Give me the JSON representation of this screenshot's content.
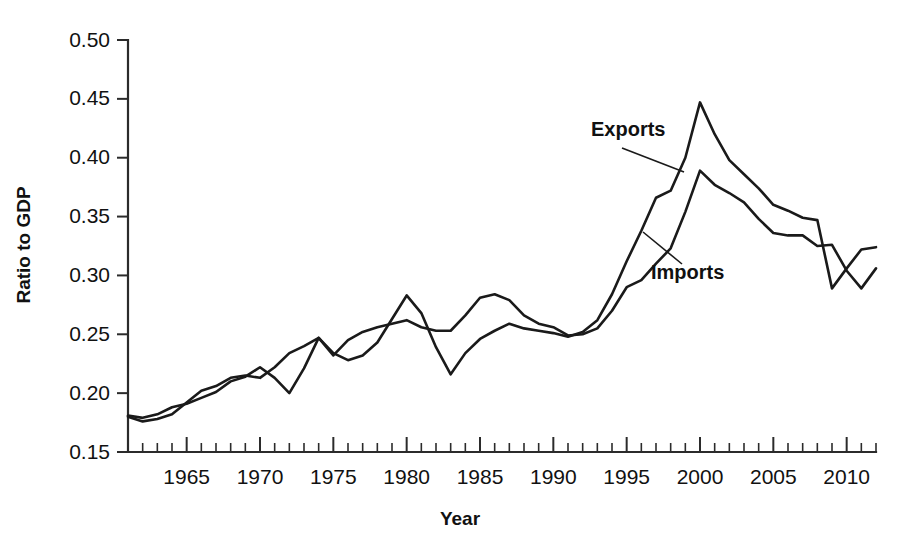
{
  "chart_data": {
    "type": "line",
    "title": "",
    "xlabel": "Year",
    "ylabel": "Ratio to GDP",
    "xlim": [
      1961,
      2012
    ],
    "ylim": [
      0.15,
      0.5
    ],
    "ytick_step": 0.05,
    "xtick_step": 1,
    "xtick_label_step": 5,
    "grid": false,
    "legend_position": "inline-annotation",
    "ytick_labels": [
      "0.15",
      "0.20",
      "0.25",
      "0.30",
      "0.35",
      "0.40",
      "0.45",
      "0.50"
    ],
    "ytick_values": [
      0.15,
      0.2,
      0.25,
      0.3,
      0.35,
      0.4,
      0.45,
      0.5
    ],
    "xtick_labels": [
      "1965",
      "1970",
      "1975",
      "1980",
      "1985",
      "1990",
      "1995",
      "2000",
      "2005",
      "2010"
    ],
    "xtick_values": [
      1965,
      1970,
      1975,
      1980,
      1985,
      1990,
      1995,
      2000,
      2005,
      2010
    ],
    "x": [
      1961,
      1962,
      1963,
      1964,
      1965,
      1966,
      1967,
      1968,
      1969,
      1970,
      1971,
      1972,
      1973,
      1974,
      1975,
      1976,
      1977,
      1978,
      1979,
      1980,
      1981,
      1982,
      1983,
      1984,
      1985,
      1986,
      1987,
      1988,
      1989,
      1990,
      1991,
      1992,
      1993,
      1994,
      1995,
      1996,
      1997,
      1998,
      1999,
      2000,
      2001,
      2002,
      2003,
      2004,
      2005,
      2006,
      2007,
      2008,
      2009,
      2010,
      2011,
      2012
    ],
    "series": [
      {
        "name": "Exports",
        "color": "#1a1a1a",
        "values": [
          0.181,
          0.179,
          0.182,
          0.188,
          0.191,
          0.196,
          0.201,
          0.21,
          0.214,
          0.222,
          0.213,
          0.2,
          0.221,
          0.247,
          0.234,
          0.228,
          0.232,
          0.243,
          0.263,
          0.283,
          0.268,
          0.239,
          0.216,
          0.234,
          0.246,
          0.253,
          0.259,
          0.255,
          0.253,
          0.251,
          0.248,
          0.252,
          0.262,
          0.284,
          0.312,
          0.338,
          0.366,
          0.372,
          0.4,
          0.447,
          0.42,
          0.398,
          0.386,
          0.374,
          0.36,
          0.355,
          0.349,
          0.347,
          0.289,
          0.306,
          0.322,
          0.324
        ]
      },
      {
        "name": "Imports",
        "color": "#1a1a1a",
        "values": [
          0.18,
          0.176,
          0.178,
          0.182,
          0.192,
          0.202,
          0.206,
          0.213,
          0.215,
          0.213,
          0.222,
          0.234,
          0.24,
          0.247,
          0.232,
          0.245,
          0.252,
          0.256,
          0.259,
          0.262,
          0.256,
          0.253,
          0.253,
          0.266,
          0.281,
          0.284,
          0.279,
          0.266,
          0.259,
          0.256,
          0.249,
          0.25,
          0.255,
          0.27,
          0.29,
          0.296,
          0.31,
          0.323,
          0.354,
          0.389,
          0.377,
          0.37,
          0.362,
          0.348,
          0.336,
          0.334,
          0.334,
          0.325,
          0.326,
          0.304,
          0.289,
          0.306
        ]
      }
    ],
    "annotations": [
      {
        "text": "Exports",
        "label_x": 591,
        "label_y": 136,
        "leader_from_x": 622,
        "leader_from_y": 148,
        "leader_to_x": 684,
        "leader_to_y": 172
      },
      {
        "text": "Imports",
        "label_x": 651,
        "label_y": 279,
        "leader_from_x": 682,
        "leader_from_y": 264,
        "leader_to_x": 643,
        "leader_to_y": 232
      }
    ]
  },
  "axes": {
    "y_axis_title": "Ratio to GDP",
    "x_axis_title": "Year"
  }
}
